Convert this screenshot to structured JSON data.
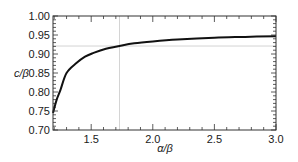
{
  "chart_data": {
    "type": "line",
    "title": "",
    "xlabel": "α/β",
    "ylabel": "c/β",
    "xlim": [
      1.19,
      3.0
    ],
    "ylim": [
      0.7,
      1.0
    ],
    "xticks": [
      1.5,
      2.0,
      2.5,
      3.0
    ],
    "xtick_labels": [
      "1.5",
      "2.0",
      "2.5",
      "3.0"
    ],
    "yticks": [
      0.7,
      0.75,
      0.8,
      0.85,
      0.9,
      0.95,
      1.0
    ],
    "ytick_labels": [
      "0.70",
      "0.75",
      "0.80",
      "0.85",
      "0.90",
      "0.95",
      "1.00"
    ],
    "grid": false,
    "reference_lines": {
      "vertical_x": 1.73,
      "horizontal_y": 0.921,
      "color": "#c8c8c8"
    },
    "series": [
      {
        "name": "c/β",
        "color": "#111111",
        "x": [
          1.19,
          1.22,
          1.25,
          1.3,
          1.38,
          1.45,
          1.52,
          1.6,
          1.73,
          1.85,
          2.0,
          2.2,
          2.5,
          2.75,
          3.0
        ],
        "y": [
          0.745,
          0.78,
          0.805,
          0.85,
          0.876,
          0.893,
          0.903,
          0.912,
          0.921,
          0.928,
          0.933,
          0.938,
          0.943,
          0.945,
          0.947
        ]
      }
    ]
  }
}
